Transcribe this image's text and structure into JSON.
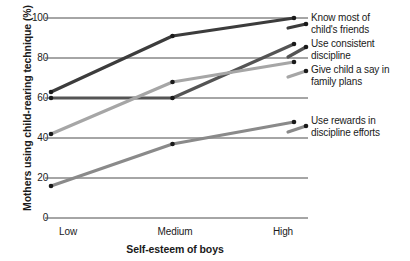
{
  "chart_data": {
    "type": "line",
    "title": "",
    "xlabel": "Self-esteem of boys",
    "ylabel": "Mothers using child-rearing technique (%)",
    "categories": [
      "Low",
      "Medium",
      "High"
    ],
    "ylim": [
      0,
      100
    ],
    "yticks": [
      "0",
      "20",
      "40",
      "60",
      "80",
      "100"
    ],
    "grid": true,
    "legend_position": "right",
    "series": [
      {
        "name": "Know most of child's friends",
        "values": [
          63,
          91,
          100
        ],
        "color": "#3c3c3c",
        "width": 3.2
      },
      {
        "name": "Use consistent discipline",
        "values": [
          60,
          60,
          87
        ],
        "color": "#545454",
        "width": 3.2
      },
      {
        "name": "Give child a say in family plans",
        "values": [
          42,
          68,
          78
        ],
        "color": "#a6a6a6",
        "width": 3.2
      },
      {
        "name": "Use rewards in discipline efforts",
        "values": [
          16,
          37,
          48
        ],
        "color": "#8a8a8a",
        "width": 3.2
      }
    ],
    "marker_color": "#1a1a1a",
    "axis_color": "#4d4d4d"
  },
  "legend": {
    "items": [
      {
        "line1": "Know most of",
        "line2": "child's friends"
      },
      {
        "line1": "Use consistent",
        "line2": "discipline"
      },
      {
        "line1": "Give child a say in",
        "line2": "family plans"
      },
      {
        "line1": "Use rewards in",
        "line2": "discipline efforts"
      }
    ]
  }
}
